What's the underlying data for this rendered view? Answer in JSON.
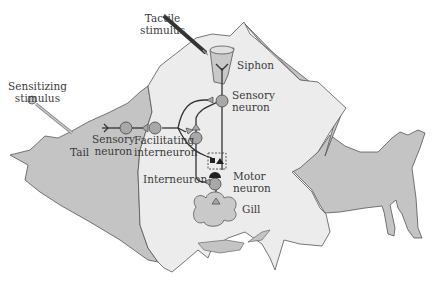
{
  "diagram": {
    "labels": {
      "tactile_stimulus_line1": "Tactile",
      "tactile_stimulus_line2": "stimulus",
      "sensitizing_stimulus_line1": "Sensitizing",
      "sensitizing_stimulus_line2": "stimulus",
      "siphon": "Siphon",
      "sensory_neuron_siphon_line1": "Sensory",
      "sensory_neuron_siphon_line2": "neuron",
      "sensory_neuron_tail_line1": "Sensory",
      "sensory_neuron_tail_line2": "neuron",
      "tail": "Tail",
      "facilitating_line1": "Facilitating",
      "facilitating_line2": "interneuron",
      "interneuron": "Interneuron",
      "motor_neuron_line1": "Motor",
      "motor_neuron_line2": "neuron",
      "gill": "Gill"
    },
    "colors": {
      "body_light": "#ececec",
      "body_dark": "#c2c2c2",
      "neuron_fill": "#a8a8a8",
      "outline": "#505050",
      "text": "#3a3a3a"
    }
  }
}
